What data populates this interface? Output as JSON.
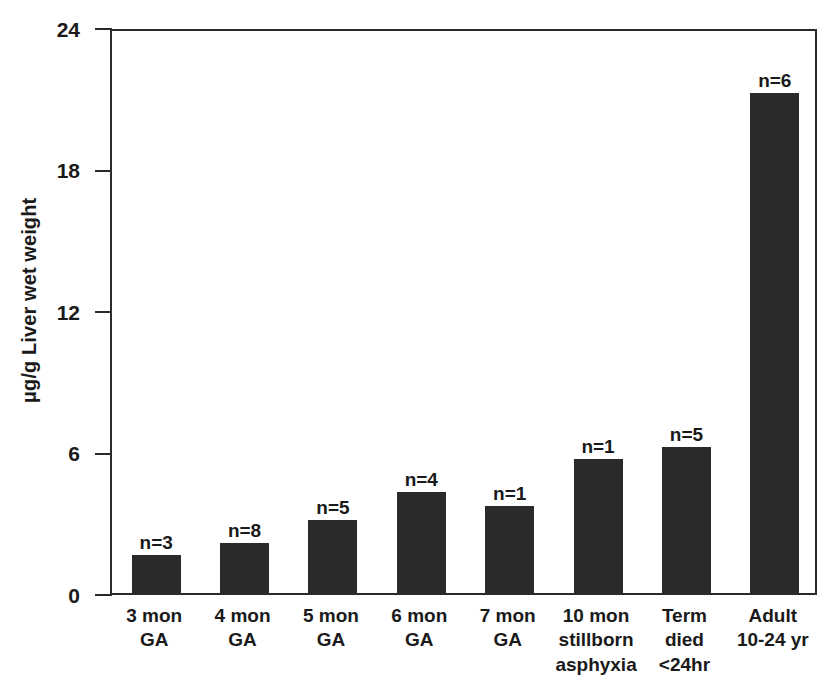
{
  "chart_data": {
    "type": "bar",
    "title": "",
    "xlabel": "",
    "ylabel": "μg/g Liver wet weight",
    "ylim": [
      0,
      24
    ],
    "yticks": [
      0,
      6,
      12,
      18,
      24
    ],
    "ytick_labels": [
      "0",
      "6",
      "12",
      "18",
      "24"
    ],
    "grid": false,
    "legend": "none",
    "bar_color": "#2a2a2a",
    "axis_color": "#2b2b2b",
    "categories": [
      "3 mon GA",
      "4 mon GA",
      "5 mon GA",
      "6 mon GA",
      "7 mon GA",
      "10 mon stillborn asphyxia",
      "Term died <24hr",
      "Adult 10-24 yr"
    ],
    "category_label_lines": [
      [
        "3 mon",
        "GA"
      ],
      [
        "4 mon",
        "GA"
      ],
      [
        "5 mon",
        "GA"
      ],
      [
        "6 mon",
        "GA"
      ],
      [
        "7 mon",
        "GA"
      ],
      [
        "10 mon",
        "stillborn",
        "asphyxia"
      ],
      [
        "Term",
        "died",
        "<24hr"
      ],
      [
        "Adult",
        "10-24 yr"
      ]
    ],
    "values": [
      1.6,
      2.1,
      3.1,
      4.3,
      3.7,
      5.7,
      6.2,
      21.2
    ],
    "point_labels": [
      "n=3",
      "n=8",
      "n=5",
      "n=4",
      "n=1",
      "n=1",
      "n=5",
      "n=6"
    ],
    "sample_sizes": [
      3,
      8,
      5,
      4,
      1,
      1,
      5,
      6
    ]
  }
}
